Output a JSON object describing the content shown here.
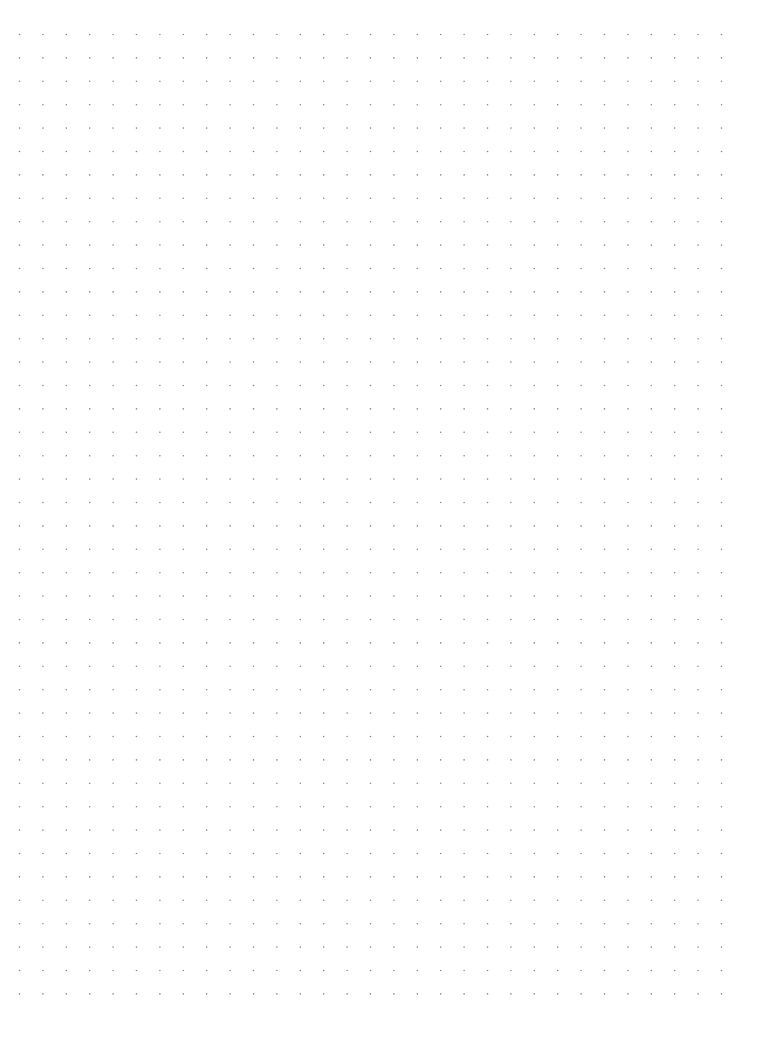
{
  "page": {
    "type": "dot-grid-paper",
    "background_color": "#ffffff",
    "dot_color": "#8a8a8a",
    "grid": {
      "columns": 31,
      "rows": 42
    }
  }
}
